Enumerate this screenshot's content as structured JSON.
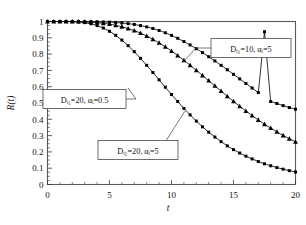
{
  "figure": {
    "background": "#ffffff",
    "frame_color": "#5a5a5a",
    "curve_color": "#1a1a1a",
    "marker_color": "#000000"
  },
  "axes": {
    "y_axis_label": "R(t)",
    "x_axis_label": "t",
    "x_ticks": [
      "0",
      "5",
      "10",
      "15",
      "20"
    ],
    "y_ticks": [
      "0",
      "0.1",
      "0.2",
      "0.3",
      "0.4",
      "0.5",
      "0.6",
      "0.7",
      "0.8",
      "0.9",
      "1"
    ]
  },
  "annotations": [
    {
      "id": "ann-top",
      "text": "Dᵢ₁=10,  αᵢ=5",
      "plain": "Di1=10, alpha_i=5"
    },
    {
      "id": "ann-mid",
      "text": "Dᵢ₁=20,  αᵢ=0.5",
      "plain": "Di1=20, alpha_i=0.5"
    },
    {
      "id": "ann-bottom",
      "text": "Dᵢ₁=20,  αᵢ=5",
      "plain": "Di1=20, alpha_i=5"
    }
  ],
  "chart_data": {
    "type": "line",
    "title": "",
    "xlabel": "t",
    "ylabel": "R(t)",
    "xlim": [
      0,
      20
    ],
    "ylim": [
      0,
      1
    ],
    "grid": false,
    "legend_position": "inline-annotations",
    "x": [
      0,
      0.5,
      1,
      1.5,
      2,
      2.5,
      3,
      3.5,
      4,
      4.5,
      5,
      5.5,
      6,
      6.5,
      7,
      7.5,
      8,
      8.5,
      9,
      9.5,
      10,
      10.5,
      11,
      11.5,
      12,
      12.5,
      13,
      13.5,
      14,
      14.5,
      15,
      15.5,
      16,
      16.5,
      17,
      17.5,
      18,
      18.5,
      19,
      19.5,
      20
    ],
    "series": [
      {
        "name": "Dᵢ₁=10, αᵢ=5",
        "marker": "square",
        "values": [
          1.0,
          1.0,
          1.0,
          1.0,
          1.0,
          1.0,
          0.999,
          0.999,
          0.998,
          0.997,
          0.996,
          0.994,
          0.991,
          0.987,
          0.982,
          0.975,
          0.967,
          0.957,
          0.945,
          0.931,
          0.915,
          0.897,
          0.877,
          0.856,
          0.833,
          0.809,
          0.784,
          0.758,
          0.731,
          0.704,
          0.676,
          0.648,
          0.62,
          0.592,
          0.564,
          0.937,
          0.509,
          0.497,
          0.484,
          0.472,
          0.462
        ]
      },
      {
        "name": "Dᵢ₁=20, αᵢ=0.5",
        "marker": "triangle",
        "values": [
          1.0,
          1.0,
          1.0,
          1.0,
          0.999,
          0.999,
          0.998,
          0.996,
          0.993,
          0.989,
          0.984,
          0.977,
          0.968,
          0.957,
          0.944,
          0.929,
          0.911,
          0.891,
          0.869,
          0.845,
          0.819,
          0.791,
          0.762,
          0.732,
          0.701,
          0.669,
          0.637,
          0.605,
          0.573,
          0.541,
          0.51,
          0.48,
          0.451,
          0.423,
          0.396,
          0.37,
          0.346,
          0.323,
          0.301,
          0.281,
          0.262
        ]
      },
      {
        "name": "Dᵢ₁=20, αᵢ=5",
        "marker": "square",
        "values": [
          1.0,
          1.0,
          1.0,
          1.0,
          0.999,
          0.997,
          0.993,
          0.986,
          0.975,
          0.96,
          0.94,
          0.915,
          0.886,
          0.852,
          0.815,
          0.774,
          0.731,
          0.687,
          0.642,
          0.597,
          0.552,
          0.509,
          0.467,
          0.427,
          0.389,
          0.354,
          0.321,
          0.291,
          0.263,
          0.237,
          0.214,
          0.193,
          0.174,
          0.157,
          0.141,
          0.127,
          0.115,
          0.104,
          0.094,
          0.085,
          0.077
        ]
      }
    ]
  }
}
